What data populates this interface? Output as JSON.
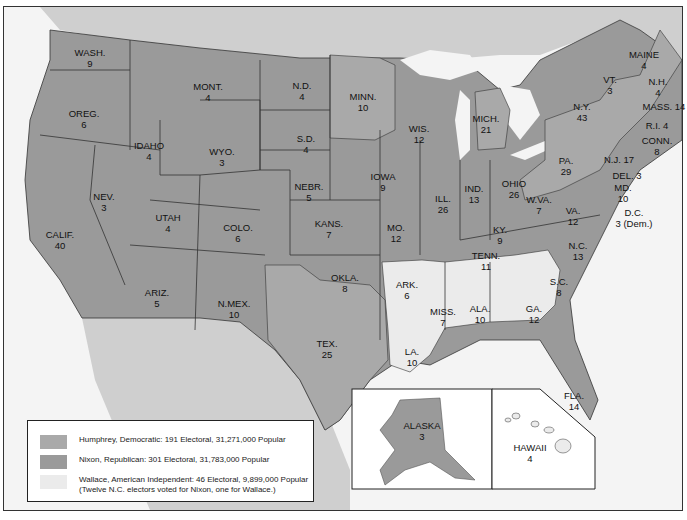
{
  "colors": {
    "humphrey": "#a9a9a9",
    "nixon": "#9a9a9a",
    "wallace": "#ebebeb",
    "canada_mexico": "#cfcfcf",
    "water": "#f4f4f4",
    "border": "#333333"
  },
  "states": [
    {
      "name": "WASH.",
      "ev": "9",
      "x": 90,
      "y": 47,
      "party": "nixon"
    },
    {
      "name": "OREG.",
      "ev": "6",
      "x": 84,
      "y": 108,
      "party": "nixon"
    },
    {
      "name": "CALIF.",
      "ev": "40",
      "x": 60,
      "y": 229,
      "party": "nixon"
    },
    {
      "name": "IDAHO",
      "ev": "4",
      "x": 149,
      "y": 140,
      "party": "nixon"
    },
    {
      "name": "NEV.",
      "ev": "3",
      "x": 104,
      "y": 191,
      "party": "nixon"
    },
    {
      "name": "MONT.",
      "ev": "4",
      "x": 208,
      "y": 81,
      "party": "nixon"
    },
    {
      "name": "WYO.",
      "ev": "3",
      "x": 222,
      "y": 146,
      "party": "nixon"
    },
    {
      "name": "UTAH",
      "ev": "4",
      "x": 168,
      "y": 212,
      "party": "nixon"
    },
    {
      "name": "COLO.",
      "ev": "6",
      "x": 238,
      "y": 222,
      "party": "nixon"
    },
    {
      "name": "ARIZ.",
      "ev": "5",
      "x": 157,
      "y": 287,
      "party": "nixon"
    },
    {
      "name": "N.MEX.",
      "ev": "10",
      "x": 234,
      "y": 298,
      "party": "nixon"
    },
    {
      "name": "N.D.",
      "ev": "4",
      "x": 302,
      "y": 80,
      "party": "nixon"
    },
    {
      "name": "S.D.",
      "ev": "4",
      "x": 306,
      "y": 133,
      "party": "nixon"
    },
    {
      "name": "NEBR.",
      "ev": "5",
      "x": 309,
      "y": 181,
      "party": "nixon"
    },
    {
      "name": "KANS.",
      "ev": "7",
      "x": 329,
      "y": 218,
      "party": "nixon"
    },
    {
      "name": "OKLA.",
      "ev": "8",
      "x": 345,
      "y": 272,
      "party": "nixon"
    },
    {
      "name": "TEX.",
      "ev": "25",
      "x": 327,
      "y": 338,
      "party": "humphrey"
    },
    {
      "name": "MINN.",
      "ev": "10",
      "x": 363,
      "y": 91,
      "party": "humphrey"
    },
    {
      "name": "IOWA",
      "ev": "9",
      "x": 383,
      "y": 171,
      "party": "nixon"
    },
    {
      "name": "MO.",
      "ev": "12",
      "x": 396,
      "y": 222,
      "party": "nixon"
    },
    {
      "name": "ARK.",
      "ev": "6",
      "x": 407,
      "y": 279,
      "party": "wallace"
    },
    {
      "name": "LA.",
      "ev": "10",
      "x": 412,
      "y": 346,
      "party": "wallace"
    },
    {
      "name": "WIS.",
      "ev": "12",
      "x": 419,
      "y": 123,
      "party": "nixon"
    },
    {
      "name": "ILL.",
      "ev": "26",
      "x": 443,
      "y": 193,
      "party": "nixon"
    },
    {
      "name": "MICH.",
      "ev": "21",
      "x": 486,
      "y": 113,
      "party": "humphrey"
    },
    {
      "name": "IND.",
      "ev": "13",
      "x": 474,
      "y": 183,
      "party": "nixon"
    },
    {
      "name": "OHIO",
      "ev": "26",
      "x": 514,
      "y": 178,
      "party": "nixon"
    },
    {
      "name": "KY.",
      "ev": "9",
      "x": 500,
      "y": 224,
      "party": "nixon"
    },
    {
      "name": "TENN.",
      "ev": "11",
      "x": 486,
      "y": 250,
      "party": "nixon"
    },
    {
      "name": "MISS.",
      "ev": "7",
      "x": 443,
      "y": 306,
      "party": "wallace"
    },
    {
      "name": "ALA.",
      "ev": "10",
      "x": 480,
      "y": 303,
      "party": "wallace"
    },
    {
      "name": "GA.",
      "ev": "12",
      "x": 534,
      "y": 303,
      "party": "wallace"
    },
    {
      "name": "FLA.",
      "ev": "14",
      "x": 574,
      "y": 390,
      "party": "nixon"
    },
    {
      "name": "S.C.",
      "ev": "8",
      "x": 559,
      "y": 276,
      "party": "nixon"
    },
    {
      "name": "N.C.",
      "ev": "13",
      "x": 578,
      "y": 240,
      "party": "nixon"
    },
    {
      "name": "VA.",
      "ev": "12",
      "x": 573,
      "y": 205,
      "party": "nixon"
    },
    {
      "name": "W.VA.",
      "ev": "7",
      "x": 539,
      "y": 194,
      "party": "humphrey"
    },
    {
      "name": "PA.",
      "ev": "29",
      "x": 566,
      "y": 155,
      "party": "humphrey"
    },
    {
      "name": "N.Y.",
      "ev": "43",
      "x": 582,
      "y": 101,
      "party": "humphrey"
    },
    {
      "name": "VT.",
      "ev": "3",
      "x": 610,
      "y": 74,
      "party": "nixon"
    },
    {
      "name": "MAINE",
      "ev": "4",
      "x": 644,
      "y": 49,
      "party": "humphrey"
    }
  ],
  "outside_labels": [
    {
      "text": "N.H.",
      "sub": "4",
      "x": 658,
      "y": 76
    },
    {
      "text": "MASS. 14",
      "sub": "",
      "x": 664,
      "y": 101
    },
    {
      "text": "R.I. 4",
      "sub": "",
      "x": 657,
      "y": 120
    },
    {
      "text": "CONN.",
      "sub": "8",
      "x": 657,
      "y": 135
    },
    {
      "text": "N.J. 17",
      "sub": "",
      "x": 619,
      "y": 154
    },
    {
      "text": "DEL. 3",
      "sub": "",
      "x": 627,
      "y": 170
    },
    {
      "text": "MD.",
      "sub": "10",
      "x": 623,
      "y": 182
    },
    {
      "text": "D.C.",
      "sub": "3 (Dem.)",
      "x": 634,
      "y": 207
    }
  ],
  "insets": {
    "alaska": {
      "name": "ALASKA",
      "ev": "3"
    },
    "hawaii": {
      "name": "HAWAII",
      "ev": "4"
    }
  },
  "legend": [
    {
      "label": "Humphrey, Democratic: 191 Electoral, 31,271,000 Popular",
      "party": "humphrey"
    },
    {
      "label": "Nixon, Republican: 301 Electoral, 31,783,000 Popular",
      "party": "nixon"
    },
    {
      "label": "Wallace, American Independent: 46 Electoral, 9,899,000 Popular",
      "note": "(Twelve N.C. electors voted for Nixon, one for Wallace.)",
      "party": "wallace"
    }
  ]
}
